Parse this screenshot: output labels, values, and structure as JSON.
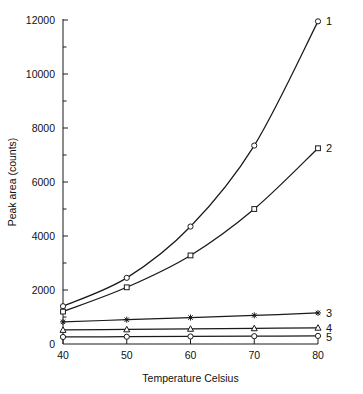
{
  "chart_data": {
    "type": "line",
    "title": "",
    "xlabel": "Temperature Celsius",
    "ylabel": "Peak area (counts)",
    "x": [
      40,
      50,
      60,
      70,
      80
    ],
    "xlim": [
      40,
      80
    ],
    "ylim": [
      0,
      12000
    ],
    "xticks": [
      "40",
      "50",
      "60",
      "70",
      "80"
    ],
    "yticks": [
      "0",
      "2000",
      "4000",
      "6000",
      "8000",
      "10000",
      "12000"
    ],
    "ytick_values": [
      0,
      2000,
      4000,
      6000,
      8000,
      10000,
      12000
    ],
    "yminor_values": [
      1000,
      3000,
      5000,
      7000,
      9000,
      11000
    ],
    "grid": false,
    "legend_position": "right-inline-labels",
    "series": [
      {
        "name": "1",
        "marker": "open-circle",
        "values": [
          1400,
          2450,
          4350,
          7350,
          11950
        ]
      },
      {
        "name": "2",
        "marker": "open-square",
        "values": [
          1200,
          2100,
          3280,
          5000,
          7250
        ]
      },
      {
        "name": "3",
        "marker": "star",
        "values": [
          820,
          900,
          980,
          1060,
          1150
        ]
      },
      {
        "name": "4",
        "marker": "open-triangle",
        "values": [
          520,
          540,
          560,
          580,
          600
        ]
      },
      {
        "name": "5",
        "marker": "open-circle",
        "values": [
          260,
          270,
          280,
          290,
          300
        ]
      }
    ]
  }
}
